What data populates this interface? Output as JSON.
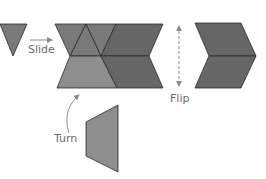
{
  "diagram": {
    "labels": {
      "slide": "Slide",
      "flip": "Flip",
      "turn": "Turn"
    },
    "colors": {
      "background": "#ffffff",
      "triangle": "#7a7a7a",
      "dark_shape": "#666666",
      "light_shape": "#8e8e8e",
      "outline": "#2a2a2a",
      "arrow": "#8a8a8a",
      "label_text": "#6b6b6b"
    },
    "shapes": [
      {
        "name": "single-triangle",
        "type": "triangle",
        "points": "0,24 27,24 13,56"
      },
      {
        "name": "composite-top-left-triangle",
        "type": "triangle",
        "points": "55,24 86,24 70,56"
      },
      {
        "name": "composite-top-middle-triangle",
        "type": "triangle",
        "points": "86,24 101,56 70,56"
      },
      {
        "name": "composite-top-right-triangle",
        "type": "triangle",
        "points": "86,24 116,24 101,56"
      },
      {
        "name": "composite-top-parallelogram",
        "type": "parallelogram",
        "points": "116,24 163,24 149,56 101,56"
      },
      {
        "name": "composite-bottom-trapezoid",
        "type": "trapezoid",
        "points": "70,56 101,56 117,88 57,88"
      },
      {
        "name": "composite-bottom-parallelogram",
        "type": "parallelogram",
        "points": "101,56 149,56 163,88 117,88"
      },
      {
        "name": "flipped-chevron-top",
        "type": "parallelogram",
        "points": "195,23 241,23 256,56 209,56"
      },
      {
        "name": "flipped-chevron-bottom",
        "type": "parallelogram",
        "points": "209,56 256,56 241,88 195,88"
      },
      {
        "name": "turned-trapezoid",
        "type": "trapezoid",
        "points": "118,105 118,172 86,156 86,122"
      }
    ]
  }
}
